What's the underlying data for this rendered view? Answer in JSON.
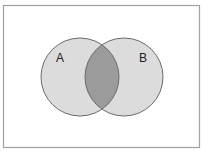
{
  "diagram": {
    "type": "venn",
    "sets": [
      {
        "label": "A",
        "cx": 80,
        "cy": 77,
        "r": 39
      },
      {
        "label": "B",
        "cx": 124,
        "cy": 77,
        "r": 39
      }
    ],
    "highlighted_region": "A ∩ B",
    "colors": {
      "set_fill": "#dcdcdc",
      "intersection_fill": "#9b9b9b",
      "stroke": "#6a6a6a",
      "frame": "#a0a0a0",
      "background": "#ffffff"
    }
  }
}
